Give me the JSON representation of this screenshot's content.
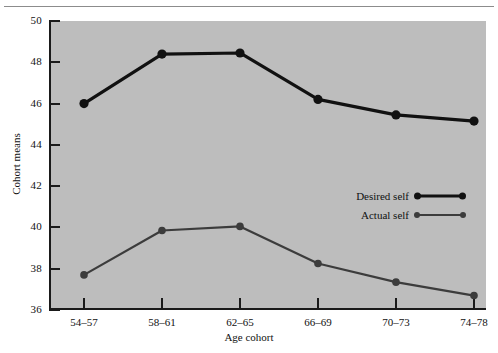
{
  "chart_data": {
    "type": "line",
    "title": "",
    "xlabel": "Age cohort",
    "ylabel": "Cohort means",
    "categories": [
      "54–57",
      "58–61",
      "62–65",
      "66–69",
      "70–73",
      "74–78"
    ],
    "ylim": [
      36,
      50
    ],
    "yticks": [
      36,
      38,
      40,
      42,
      44,
      46,
      48,
      50
    ],
    "ytick_labels": [
      "36",
      "38",
      "40",
      "42",
      "44",
      "46",
      "48",
      "50"
    ],
    "grid": false,
    "legend_position": "center-right",
    "plot_background": "#bdbdbd",
    "series": [
      {
        "name": "Desired self",
        "values": [
          46.0,
          48.4,
          48.45,
          46.2,
          45.45,
          45.15
        ],
        "color": "#111111",
        "line_width": 3.2,
        "marker": "circle",
        "marker_size": 4.6
      },
      {
        "name": "Actual self",
        "values": [
          37.7,
          39.85,
          40.05,
          38.25,
          37.35,
          36.7
        ],
        "color": "#3c3c3c",
        "line_width": 2.2,
        "marker": "circle",
        "marker_size": 3.8
      }
    ]
  },
  "legend": {
    "items": [
      {
        "label": "Desired self"
      },
      {
        "label": "Actual self"
      }
    ]
  }
}
